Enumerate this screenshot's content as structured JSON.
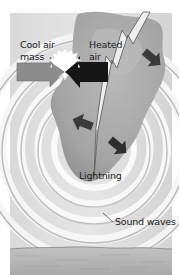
{
  "diagram": {
    "labels": {
      "cool_air_line1": "Cool air",
      "cool_air_line2": "mass",
      "heated_air_line1": "Heated",
      "heated_air_line2": "air",
      "lightning": "Lightning",
      "sound_waves": "Sound waves"
    },
    "elements": {
      "cool_air_arrow": {
        "direction": "right",
        "color": "#8c8c8c"
      },
      "heated_air_arrow": {
        "direction": "left",
        "color": "#1a1a1a"
      },
      "collision_burst": {
        "color": "#ffffff"
      },
      "lightning_bolt": {
        "color": "#ececec"
      },
      "expansion_arrows": {
        "count": 3,
        "color": "#3a3a3a"
      },
      "sound_wave_rings": {
        "count": 5
      },
      "ground": {
        "color": "#b4b4b4"
      }
    },
    "colors": {
      "background": "#ffffff",
      "cloud": "#a8a8a8",
      "wave_band": "#d2d2d2",
      "text": "#222222"
    }
  }
}
